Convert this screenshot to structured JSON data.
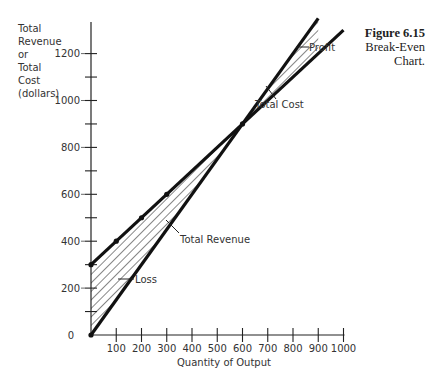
{
  "figure": {
    "number": "Figure 6.15",
    "caption_line1": "Break-Even",
    "caption_line2": "Chart."
  },
  "chart_data": {
    "type": "line",
    "title": "Break-Even Chart",
    "xlabel": "Quantity of Output",
    "ylabel": "Total Revenue or Total Cost (dollars)",
    "ylabel_lines": [
      "Total",
      "Revenue",
      "or",
      "Total",
      "Cost",
      "(dollars)"
    ],
    "xlim": [
      0,
      1000
    ],
    "ylim": [
      0,
      1350
    ],
    "x_ticks": [
      100,
      200,
      300,
      400,
      500,
      600,
      700,
      800,
      900,
      1000
    ],
    "x_tick_labels": [
      "100",
      "200",
      "300",
      "400",
      "500",
      "600",
      "700",
      "800",
      "900",
      "1000"
    ],
    "y_ticks": [
      0,
      100,
      200,
      300,
      400,
      500,
      600,
      700,
      800,
      900,
      1000,
      1100,
      1200
    ],
    "y_tick_labels": [
      "0",
      "",
      "200",
      "",
      "400",
      "",
      "600",
      "",
      "800",
      "",
      "1000",
      "",
      "1200"
    ],
    "grid": false,
    "series": [
      {
        "name": "Total Cost",
        "x": [
          0,
          100,
          200,
          300,
          400,
          500,
          600,
          700,
          800,
          900,
          1000
        ],
        "values": [
          300,
          400,
          500,
          600,
          700,
          800,
          900,
          1000,
          1100,
          1200,
          1300
        ]
      },
      {
        "name": "Total Revenue",
        "x": [
          0,
          100,
          200,
          300,
          400,
          500,
          600,
          700,
          800,
          900
        ],
        "values": [
          0,
          150,
          300,
          450,
          600,
          750,
          900,
          1050,
          1200,
          1350
        ]
      }
    ],
    "annotations": [
      {
        "text": "Profit",
        "region": "hatched area between lines for quantity > 600"
      },
      {
        "text": "Loss",
        "region": "hatched area between lines for quantity < 600"
      },
      {
        "text": "Total Cost",
        "points_to": "Total Cost line"
      },
      {
        "text": "Total Revenue",
        "points_to": "Total Revenue line"
      }
    ],
    "break_even": {
      "quantity": 600,
      "dollars": 900
    }
  }
}
